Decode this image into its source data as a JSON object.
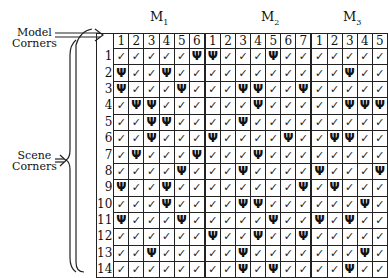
{
  "labels": {
    "model_corners": [
      "Model",
      "Corners"
    ],
    "scene_corners": [
      "Scene",
      "Corners"
    ]
  },
  "models": [
    {
      "name": "M",
      "sub": "1",
      "columns": [
        "1",
        "2",
        "3",
        "4",
        "5",
        "6"
      ]
    },
    {
      "name": "M",
      "sub": "2",
      "columns": [
        "1",
        "2",
        "3",
        "4",
        "5",
        "6",
        "7"
      ]
    },
    {
      "name": "M",
      "sub": "3",
      "columns": [
        "1",
        "2",
        "3",
        "4",
        "5"
      ]
    }
  ],
  "legend": {
    "c": "✓",
    "x": "Ψ"
  },
  "rows": [
    {
      "label": "1",
      "cells": [
        "c",
        "c",
        "c",
        "c",
        "c",
        "x",
        "x",
        "c",
        "c",
        "c",
        "x",
        "c",
        "c",
        "c",
        "c",
        "c",
        "c",
        "c"
      ]
    },
    {
      "label": "2",
      "cells": [
        "x",
        "c",
        "c",
        "x",
        "c",
        "c",
        "c",
        "c",
        "c",
        "c",
        "c",
        "c",
        "c",
        "c",
        "c",
        "x",
        "c",
        "c"
      ]
    },
    {
      "label": "3",
      "cells": [
        "x",
        "c",
        "c",
        "c",
        "x",
        "c",
        "c",
        "c",
        "x",
        "x",
        "c",
        "c",
        "x",
        "c",
        "c",
        "c",
        "c",
        "c"
      ]
    },
    {
      "label": "4",
      "cells": [
        "c",
        "x",
        "x",
        "c",
        "c",
        "c",
        "c",
        "c",
        "c",
        "x",
        "c",
        "c",
        "c",
        "c",
        "c",
        "x",
        "x",
        "x"
      ]
    },
    {
      "label": "5",
      "cells": [
        "c",
        "c",
        "x",
        "x",
        "c",
        "c",
        "c",
        "c",
        "x",
        "c",
        "c",
        "c",
        "c",
        "c",
        "c",
        "c",
        "c",
        "c"
      ]
    },
    {
      "label": "6",
      "cells": [
        "c",
        "c",
        "x",
        "c",
        "c",
        "c",
        "x",
        "c",
        "c",
        "c",
        "c",
        "x",
        "c",
        "c",
        "x",
        "x",
        "c",
        "c"
      ]
    },
    {
      "label": "7",
      "cells": [
        "c",
        "x",
        "c",
        "c",
        "c",
        "x",
        "c",
        "c",
        "c",
        "x",
        "c",
        "c",
        "c",
        "c",
        "c",
        "c",
        "c",
        "c"
      ]
    },
    {
      "label": "8",
      "cells": [
        "c",
        "c",
        "c",
        "c",
        "x",
        "c",
        "c",
        "c",
        "x",
        "c",
        "c",
        "c",
        "c",
        "x",
        "c",
        "c",
        "c",
        "x"
      ]
    },
    {
      "label": "9",
      "cells": [
        "x",
        "c",
        "c",
        "x",
        "c",
        "c",
        "c",
        "c",
        "c",
        "c",
        "c",
        "c",
        "x",
        "c",
        "x",
        "c",
        "c",
        "c"
      ]
    },
    {
      "label": "10",
      "cells": [
        "c",
        "c",
        "c",
        "x",
        "c",
        "c",
        "c",
        "c",
        "x",
        "x",
        "c",
        "c",
        "c",
        "c",
        "c",
        "c",
        "x",
        "c"
      ]
    },
    {
      "label": "11",
      "cells": [
        "x",
        "c",
        "c",
        "c",
        "x",
        "c",
        "c",
        "c",
        "c",
        "c",
        "x",
        "c",
        "c",
        "x",
        "c",
        "x",
        "c",
        "c"
      ]
    },
    {
      "label": "12",
      "cells": [
        "c",
        "c",
        "c",
        "c",
        "c",
        "c",
        "x",
        "c",
        "c",
        "x",
        "c",
        "c",
        "x",
        "c",
        "c",
        "c",
        "c",
        "c"
      ]
    },
    {
      "label": "13",
      "cells": [
        "c",
        "c",
        "x",
        "c",
        "c",
        "c",
        "c",
        "c",
        "x",
        "c",
        "c",
        "c",
        "c",
        "c",
        "c",
        "c",
        "x",
        "c"
      ]
    },
    {
      "label": "14",
      "cells": [
        "c",
        "c",
        "c",
        "c",
        "c",
        "c",
        "c",
        "c",
        "x",
        "c",
        "x",
        "c",
        "c",
        "c",
        "c",
        "x",
        "c",
        "c"
      ]
    }
  ]
}
